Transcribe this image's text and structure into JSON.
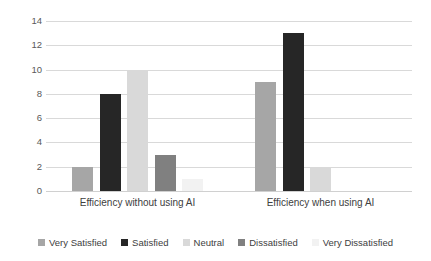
{
  "chart_data": {
    "type": "bar",
    "title": "",
    "subtitle": "",
    "xlabel": "",
    "ylabel": "",
    "categories": [
      "Efficiency without using AI",
      "Efficiency when using AI"
    ],
    "series": [
      {
        "name": "Very Satisfied",
        "color": "#a6a6a6",
        "values": [
          2,
          9
        ]
      },
      {
        "name": "Satisfied",
        "color": "#262626",
        "values": [
          8,
          13
        ]
      },
      {
        "name": "Neutral",
        "color": "#d9d9d9",
        "values": [
          10,
          2
        ]
      },
      {
        "name": "Dissatisfied",
        "color": "#808080",
        "values": [
          3,
          0
        ]
      },
      {
        "name": "Very Dissatisfied",
        "color": "#f2f2f2",
        "values": [
          1,
          0
        ]
      }
    ],
    "ylim": [
      0,
      14
    ],
    "yticks": [
      0,
      2,
      4,
      6,
      8,
      10,
      12,
      14
    ],
    "ytick_labels": [
      "0",
      "2",
      "4",
      "6",
      "8",
      "10",
      "12",
      "14"
    ],
    "grid": true,
    "grid_axis": "y",
    "grid_color": "#d9d9d9",
    "legend_position": "bottom",
    "axis_text_color": "#595959",
    "background_color": "#ffffff"
  }
}
